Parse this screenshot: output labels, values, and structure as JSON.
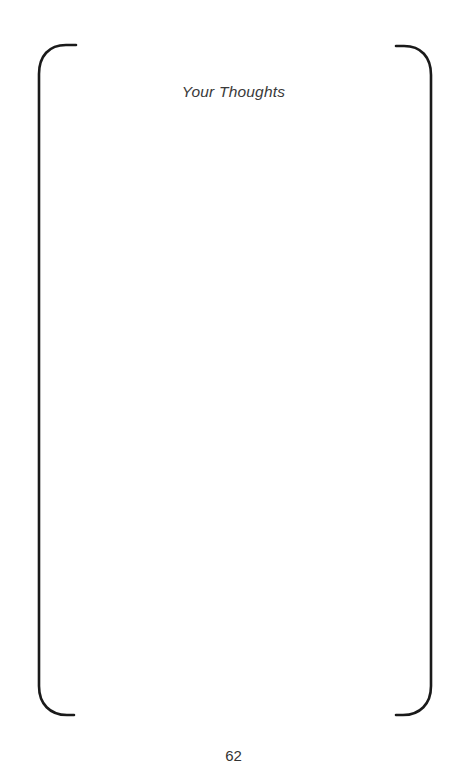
{
  "page": {
    "title": "Your Thoughts",
    "page_number": "62",
    "background_color": "#ffffff",
    "text_color": "#3a3a3a",
    "page_number_color": "#333333"
  },
  "frame": {
    "name": "bracket-frame",
    "stroke_color": "#1a1a1a",
    "stroke_width": 2.6,
    "left_bracket_label": "left-bracket",
    "right_bracket_label": "right-bracket"
  },
  "writing_area": {
    "content": "",
    "placeholder": ""
  }
}
